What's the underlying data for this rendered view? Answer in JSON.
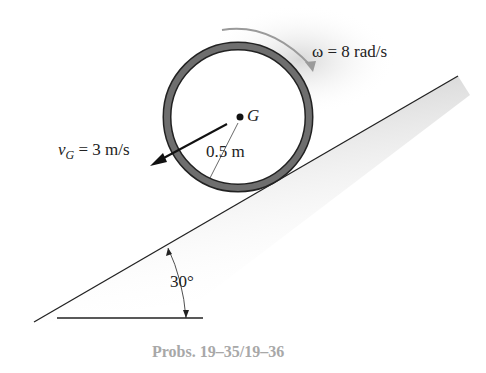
{
  "figure": {
    "omega_label": "ω = 8 rad/s",
    "velocity_label_v": "v",
    "velocity_label_sub": "G",
    "velocity_label_rest": " = 3 m/s",
    "center_label": "G",
    "radius_label": "0.5 m",
    "angle_label": "30°",
    "caption": "Probs. 19–35/19–36"
  },
  "colors": {
    "ring": "#6e6e6e",
    "shadow": "#d0d0d0",
    "caption": "#a8a8a8",
    "omega_arrow": "#9a9a9a"
  }
}
